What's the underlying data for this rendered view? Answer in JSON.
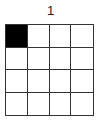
{
  "title": "1",
  "grid": {
    "rows": 4,
    "cols": 4,
    "filled_color": "#000000",
    "empty_color": "#ffffff",
    "cells": [
      [
        1,
        0,
        0,
        0
      ],
      [
        0,
        0,
        0,
        0
      ],
      [
        0,
        0,
        0,
        0
      ],
      [
        0,
        0,
        0,
        0
      ]
    ]
  }
}
